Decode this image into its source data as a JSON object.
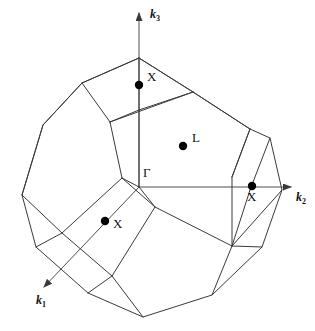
{
  "figure": {
    "type": "brillouin-zone-diagram",
    "background_color": "#ffffff",
    "line_color": "#3a3a3a",
    "text_color": "#111111",
    "marker_color": "#000000"
  },
  "axes": [
    {
      "name": "k1",
      "label_text": "k",
      "label_sub": "1",
      "label_x": 36,
      "label_y": 294,
      "from": [
        139,
        187
      ],
      "to": [
        44,
        287
      ],
      "arrow": true
    },
    {
      "name": "k2",
      "label_text": "k",
      "label_sub": "2",
      "label_x": 296,
      "label_y": 191,
      "from": [
        139,
        187
      ],
      "to": [
        291,
        187
      ],
      "arrow": true
    },
    {
      "name": "k3",
      "label_text": "k",
      "label_sub": "3",
      "label_x": 150,
      "label_y": 8,
      "from": [
        139,
        187
      ],
      "to": [
        139,
        13
      ],
      "arrow": true
    }
  ],
  "origin": {
    "name": "gamma",
    "label": "Γ",
    "label_x": 143,
    "label_y": 166,
    "point": [
      139,
      187
    ]
  },
  "symmetry_points": [
    {
      "name": "X-top",
      "label": "X",
      "dot_x": 139,
      "dot_y": 85,
      "dot_r": 4.2,
      "label_x": 147,
      "label_y": 70
    },
    {
      "name": "L-center",
      "label": "L",
      "dot_x": 183,
      "dot_y": 146,
      "dot_r": 4.2,
      "label_x": 192,
      "label_y": 131
    },
    {
      "name": "X-right",
      "label": "X",
      "dot_x": 252,
      "dot_y": 186,
      "dot_r": 4.2,
      "label_x": 247,
      "label_y": 190
    },
    {
      "name": "X-lower-left",
      "label": "X",
      "dot_x": 105,
      "dot_y": 221,
      "dot_r": 4.2,
      "label_x": 113,
      "label_y": 217
    }
  ],
  "polyhedron": {
    "silhouette": [
      [
        139,
        58
      ],
      [
        82,
        83
      ],
      [
        43,
        125
      ],
      [
        22,
        195
      ],
      [
        36,
        247
      ],
      [
        88,
        293
      ],
      [
        143,
        317
      ],
      [
        212,
        295
      ],
      [
        262,
        247
      ],
      [
        282,
        190
      ],
      [
        270,
        138
      ],
      [
        250,
        129
      ],
      [
        193,
        92
      ]
    ],
    "internal_edges": [
      [
        [
          139,
          58
        ],
        [
          193,
          92
        ]
      ],
      [
        [
          139,
          58
        ],
        [
          82,
          83
        ]
      ],
      [
        [
          82,
          83
        ],
        [
          110,
          122
        ]
      ],
      [
        [
          110,
          122
        ],
        [
          139,
          110
        ]
      ],
      [
        [
          139,
          110
        ],
        [
          139,
          58
        ]
      ],
      [
        [
          110,
          122
        ],
        [
          193,
          92
        ]
      ],
      [
        [
          139,
          110
        ],
        [
          193,
          92
        ]
      ],
      [
        [
          110,
          122
        ],
        [
          122,
          178
        ]
      ],
      [
        [
          122,
          178
        ],
        [
          139,
          187
        ]
      ],
      [
        [
          139,
          187
        ],
        [
          139,
          110
        ]
      ],
      [
        [
          22,
          195
        ],
        [
          43,
          125
        ]
      ],
      [
        [
          43,
          125
        ],
        [
          82,
          83
        ]
      ],
      [
        [
          122,
          178
        ],
        [
          155,
          207
        ]
      ],
      [
        [
          155,
          207
        ],
        [
          139,
          187
        ]
      ],
      [
        [
          155,
          207
        ],
        [
          232,
          246
        ]
      ],
      [
        [
          232,
          246
        ],
        [
          282,
          190
        ]
      ],
      [
        [
          232,
          246
        ],
        [
          262,
          247
        ]
      ],
      [
        [
          250,
          129
        ],
        [
          232,
          177
        ]
      ],
      [
        [
          232,
          177
        ],
        [
          232,
          246
        ]
      ],
      [
        [
          270,
          138
        ],
        [
          250,
          190
        ]
      ],
      [
        [
          250,
          190
        ],
        [
          232,
          246
        ]
      ],
      [
        [
          232,
          177
        ],
        [
          250,
          129
        ]
      ],
      [
        [
          122,
          178
        ],
        [
          62,
          233
        ]
      ],
      [
        [
          62,
          233
        ],
        [
          36,
          247
        ]
      ],
      [
        [
          62,
          233
        ],
        [
          22,
          195
        ]
      ],
      [
        [
          62,
          233
        ],
        [
          112,
          276
        ]
      ],
      [
        [
          112,
          276
        ],
        [
          155,
          207
        ]
      ],
      [
        [
          112,
          276
        ],
        [
          143,
          317
        ]
      ],
      [
        [
          112,
          276
        ],
        [
          88,
          293
        ]
      ],
      [
        [
          193,
          92
        ],
        [
          250,
          129
        ]
      ],
      [
        [
          212,
          295
        ],
        [
          232,
          246
        ]
      ]
    ]
  }
}
